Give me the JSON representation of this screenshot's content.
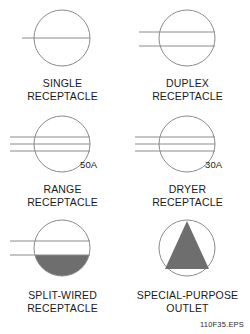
{
  "figure": {
    "id_label": "110F35.EPS",
    "stroke_color": "#8a8a8a",
    "fill_color": "#6e6e6e",
    "text_color": "#1a1a1a",
    "background": "#ffffff"
  },
  "symbols": [
    {
      "key": "single-receptacle",
      "icon_name": "single-receptacle-symbol",
      "caption": "SINGLE\nRECEPTACLE",
      "lines": 1,
      "rating": "",
      "fill": "none"
    },
    {
      "key": "duplex-receptacle",
      "icon_name": "duplex-receptacle-symbol",
      "caption": "DUPLEX\nRECEPTACLE",
      "lines": 2,
      "rating": "",
      "fill": "none"
    },
    {
      "key": "range-receptacle",
      "icon_name": "range-receptacle-symbol",
      "caption": "RANGE\nRECEPTACLE",
      "lines": 3,
      "rating": "50A",
      "fill": "none"
    },
    {
      "key": "dryer-receptacle",
      "icon_name": "dryer-receptacle-symbol",
      "caption": "DRYER\nRECEPTACLE",
      "lines": 3,
      "rating": "30A",
      "fill": "none"
    },
    {
      "key": "split-wired-receptacle",
      "icon_name": "split-wired-receptacle-symbol",
      "caption": "SPLIT-WIRED\nRECEPTACLE",
      "lines": 2,
      "rating": "",
      "fill": "lower-half"
    },
    {
      "key": "special-purpose-outlet",
      "icon_name": "special-purpose-outlet-symbol",
      "caption": "SPECIAL-PURPOSE\nOUTLET",
      "lines": 0,
      "rating": "",
      "fill": "triangle"
    }
  ]
}
